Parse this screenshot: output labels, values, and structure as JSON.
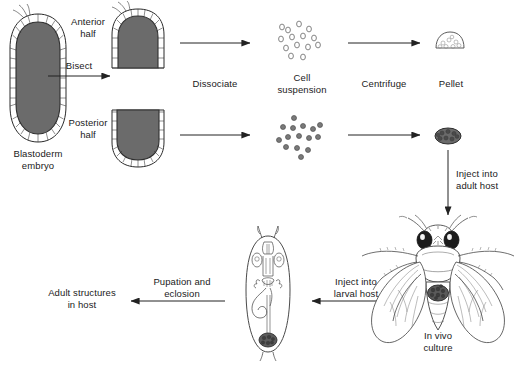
{
  "diagram": {
    "type": "flow-diagram",
    "background_color": "#ffffff",
    "ink_color": "#1a1a1a",
    "fill_gray": "#6e6e6e"
  },
  "labels": {
    "blastoderm_embryo": "Blastoderm\nembryo",
    "bisect": "Bisect",
    "anterior_half": "Anterior\nhalf",
    "posterior_half": "Posterior\nhalf",
    "dissociate": "Dissociate",
    "cell_suspension": "Cell\nsuspension",
    "centrifuge": "Centrifuge",
    "pellet": "Pellet",
    "inject_adult": "Inject into\nadult host",
    "in_vivo_culture": "In vivo\nculture",
    "inject_larval": "Inject into\nlarval host",
    "pupation_eclosion": "Pupation and\neclosion",
    "adult_structures": "Adult structures\nin host"
  },
  "stages": [
    {
      "id": "blastoderm-embryo",
      "label": "Blastoderm embryo",
      "shape": "oval-embryo",
      "x": 38,
      "y": 78
    },
    {
      "id": "anterior-half",
      "label": "Anterior half",
      "shape": "dome-up",
      "x": 138,
      "y": 37
    },
    {
      "id": "posterior-half",
      "label": "Posterior half",
      "shape": "dome-down",
      "x": 138,
      "y": 137
    },
    {
      "id": "cell-suspension-anterior",
      "label": "Cell suspension (anterior)",
      "shape": "open-circles",
      "x": 302,
      "y": 44,
      "cell_count": 14,
      "cell_style": "hollow"
    },
    {
      "id": "cell-suspension-posterior",
      "label": "Cell suspension (posterior)",
      "shape": "filled-circles",
      "x": 302,
      "y": 136,
      "cell_count": 15,
      "cell_style": "filled"
    },
    {
      "id": "pellet-anterior",
      "label": "Pellet (anterior)",
      "shape": "mound",
      "x": 450,
      "y": 44
    },
    {
      "id": "pellet-posterior",
      "label": "Pellet (posterior)",
      "shape": "blob",
      "x": 448,
      "y": 136
    },
    {
      "id": "adult-fly",
      "label": "Adult host fly",
      "shape": "drosophila-dorsal",
      "x": 438,
      "y": 290
    },
    {
      "id": "larva",
      "label": "Larval host",
      "shape": "larva",
      "x": 268,
      "y": 295
    }
  ],
  "arrows": [
    {
      "id": "arrow-bisect",
      "label": "Bisect",
      "from": "blastoderm-embryo",
      "to": "halves",
      "direction": "right"
    },
    {
      "id": "arrow-dissociate-anterior",
      "label": "Dissociate",
      "from": "anterior-half",
      "to": "cell-suspension-anterior",
      "direction": "right"
    },
    {
      "id": "arrow-dissociate-posterior",
      "label": "Dissociate",
      "from": "posterior-half",
      "to": "cell-suspension-posterior",
      "direction": "right"
    },
    {
      "id": "arrow-centrifuge-anterior",
      "label": "Centrifuge",
      "from": "cell-suspension-anterior",
      "to": "pellet-anterior",
      "direction": "right"
    },
    {
      "id": "arrow-centrifuge-posterior",
      "label": "Centrifuge",
      "from": "cell-suspension-posterior",
      "to": "pellet-posterior",
      "direction": "right"
    },
    {
      "id": "arrow-inject-adult",
      "label": "Inject into adult host",
      "from": "pellet-posterior",
      "to": "adult-fly",
      "direction": "down"
    },
    {
      "id": "arrow-inject-larval",
      "label": "Inject into larval host",
      "from": "adult-fly",
      "to": "larva",
      "direction": "left"
    },
    {
      "id": "arrow-pupation",
      "label": "Pupation and eclosion",
      "from": "larva",
      "to": "adult-structures",
      "direction": "left"
    }
  ]
}
